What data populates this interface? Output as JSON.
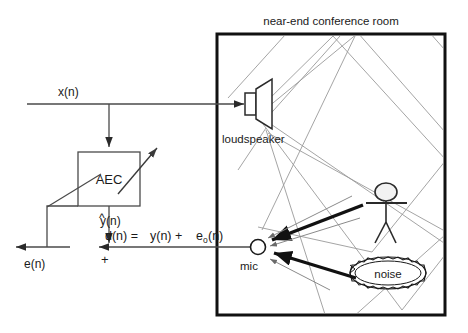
{
  "diagram": {
    "room": {
      "label": "near-end conference room",
      "border_color": "#111111"
    },
    "blocks": {
      "aec": {
        "label": "AEC",
        "adaptive_arrow_name": "adaptive-filter-arrow"
      }
    },
    "devices": {
      "loudspeaker": {
        "label": "loudspeaker"
      },
      "mic": {
        "label": "mic"
      },
      "noise": {
        "label": "noise"
      },
      "person": {
        "label": ""
      }
    },
    "signals": {
      "x": "x(n)",
      "y_hat_base": "y",
      "y_hat_tail": "(n)",
      "y_hat_accent": "^",
      "e": "e(n)",
      "d_equation_part1": "d(n) =",
      "d_equation_part2": "y(n) +",
      "d_equation_part3": "e",
      "d_equation_sub": "o",
      "d_equation_part4": "(n)",
      "plus_sign": "+"
    },
    "colors": {
      "ink": "#1a1a1a",
      "line": "#4a4a4a",
      "ray": "#9a9a9a",
      "thick": "#111111",
      "background": "#ffffff"
    }
  }
}
